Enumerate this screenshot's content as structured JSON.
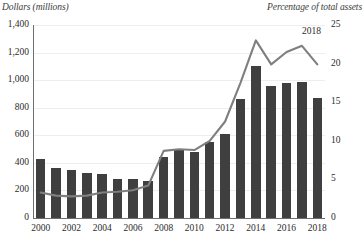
{
  "chart_data": {
    "type": "bar",
    "title": "",
    "subtitle": "",
    "xlabel": "",
    "ylabel": "Dollars (millions)",
    "y2label": "Percentage of total assets",
    "grid": true,
    "legend_position": "none",
    "annotations": [
      {
        "text": "2018",
        "series": "Percentage of total assets",
        "x": "2018"
      }
    ],
    "categories": [
      "2000",
      "2001",
      "2002",
      "2003",
      "2004",
      "2005",
      "2006",
      "2007",
      "2008",
      "2009",
      "2010",
      "2011",
      "2012",
      "2013",
      "2014",
      "2015",
      "2016",
      "2017",
      "2018"
    ],
    "x_tick_labels": [
      "2000",
      "",
      "2002",
      "",
      "2004",
      "",
      "2006",
      "",
      "2008",
      "",
      "2010",
      "",
      "2012",
      "",
      "2014",
      "",
      "2016",
      "",
      "2018"
    ],
    "ylim": [
      0,
      1400
    ],
    "y_ticks": [
      0,
      200,
      400,
      600,
      800,
      1000,
      1200,
      1400
    ],
    "y_tick_labels": [
      "0",
      "200",
      "400",
      "600",
      "800",
      "1,000",
      "1,200",
      "1,400"
    ],
    "y2lim": [
      0,
      25
    ],
    "y2_ticks": [
      0,
      5,
      10,
      15,
      20,
      25
    ],
    "y2_tick_labels": [
      "0",
      "5",
      "10",
      "15",
      "20",
      "25"
    ],
    "series": [
      {
        "name": "Dollars (millions)",
        "type": "bar",
        "axis": "left",
        "color": "#3f3f3f",
        "values": [
          430,
          360,
          350,
          330,
          320,
          285,
          285,
          265,
          440,
          490,
          480,
          550,
          610,
          860,
          1100,
          960,
          980,
          985,
          870
        ]
      },
      {
        "name": "Percentage of total assets",
        "type": "line",
        "axis": "right",
        "color": "#7f7f7f",
        "values": [
          3.3,
          2.9,
          2.8,
          2.9,
          3.3,
          3.4,
          3.6,
          4.2,
          8.7,
          8.9,
          8.8,
          10.0,
          12.5,
          17.5,
          23.0,
          19.9,
          21.5,
          22.3,
          19.9
        ]
      }
    ]
  }
}
